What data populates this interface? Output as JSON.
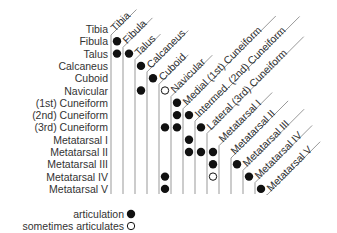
{
  "diagram": {
    "type": "articulation-matrix",
    "bones": [
      "Tibia",
      "Fibula",
      "Talus",
      "Calcaneus",
      "Cuboid",
      "Navicular",
      "(1st) Cuneiform",
      "(2nd) Cuneiform",
      "(3rd) Cuneiform",
      "Metatarsal I",
      "Metatarsal II",
      "Metatarsal III",
      "Metatarsal IV",
      "Metatarsal V"
    ],
    "column_labels": [
      "Tibia",
      "Fibula",
      "Talus",
      "Calcaneus",
      "Cuboid",
      "Navicular",
      "Medial (1st) Cuneiform",
      "Intermed. (2nd) Cuneiform",
      "Lateral (3rd) Cuneiform",
      "Metatarsal I",
      "Metatarsal II",
      "Metatarsal III",
      "Metatarsal IV",
      "Metatarsal V"
    ],
    "articulations": [
      {
        "row": "Fibula",
        "col": "Tibia",
        "type": "articulation"
      },
      {
        "row": "Talus",
        "col": "Tibia",
        "type": "articulation"
      },
      {
        "row": "Talus",
        "col": "Fibula",
        "type": "articulation"
      },
      {
        "row": "Calcaneus",
        "col": "Talus",
        "type": "articulation"
      },
      {
        "row": "Cuboid",
        "col": "Calcaneus",
        "type": "articulation"
      },
      {
        "row": "Navicular",
        "col": "Talus",
        "type": "articulation"
      },
      {
        "row": "Navicular",
        "col": "Cuboid",
        "type": "sometimes"
      },
      {
        "row": "(1st) Cuneiform",
        "col": "Navicular",
        "type": "articulation"
      },
      {
        "row": "(2nd) Cuneiform",
        "col": "Navicular",
        "type": "articulation"
      },
      {
        "row": "(2nd) Cuneiform",
        "col": "Medial (1st) Cuneiform",
        "type": "articulation"
      },
      {
        "row": "(3rd) Cuneiform",
        "col": "Cuboid",
        "type": "articulation"
      },
      {
        "row": "(3rd) Cuneiform",
        "col": "Navicular",
        "type": "articulation"
      },
      {
        "row": "(3rd) Cuneiform",
        "col": "Intermed. (2nd) Cuneiform",
        "type": "articulation"
      },
      {
        "row": "Metatarsal I",
        "col": "Medial (1st) Cuneiform",
        "type": "articulation"
      },
      {
        "row": "Metatarsal II",
        "col": "Medial (1st) Cuneiform",
        "type": "articulation"
      },
      {
        "row": "Metatarsal II",
        "col": "Intermed. (2nd) Cuneiform",
        "type": "articulation"
      },
      {
        "row": "Metatarsal II",
        "col": "Lateral (3rd) Cuneiform",
        "type": "articulation"
      },
      {
        "row": "Metatarsal III",
        "col": "Lateral (3rd) Cuneiform",
        "type": "articulation"
      },
      {
        "row": "Metatarsal III",
        "col": "Metatarsal II",
        "type": "articulation"
      },
      {
        "row": "Metatarsal IV",
        "col": "Cuboid",
        "type": "articulation"
      },
      {
        "row": "Metatarsal IV",
        "col": "Lateral (3rd) Cuneiform",
        "type": "sometimes"
      },
      {
        "row": "Metatarsal IV",
        "col": "Metatarsal III",
        "type": "articulation"
      },
      {
        "row": "Metatarsal V",
        "col": "Cuboid",
        "type": "articulation"
      },
      {
        "row": "Metatarsal V",
        "col": "Metatarsal IV",
        "type": "articulation"
      }
    ],
    "matrix": [
      [
        0,
        0,
        0,
        0,
        0,
        0,
        0,
        0,
        0,
        0,
        0,
        0,
        0,
        0
      ],
      [
        1,
        0,
        0,
        0,
        0,
        0,
        0,
        0,
        0,
        0,
        0,
        0,
        0,
        0
      ],
      [
        1,
        1,
        0,
        0,
        0,
        0,
        0,
        0,
        0,
        0,
        0,
        0,
        0,
        0
      ],
      [
        0,
        0,
        1,
        0,
        0,
        0,
        0,
        0,
        0,
        0,
        0,
        0,
        0,
        0
      ],
      [
        0,
        0,
        0,
        1,
        0,
        0,
        0,
        0,
        0,
        0,
        0,
        0,
        0,
        0
      ],
      [
        0,
        0,
        1,
        0,
        2,
        0,
        0,
        0,
        0,
        0,
        0,
        0,
        0,
        0
      ],
      [
        0,
        0,
        0,
        0,
        0,
        1,
        0,
        0,
        0,
        0,
        0,
        0,
        0,
        0
      ],
      [
        0,
        0,
        0,
        0,
        0,
        1,
        1,
        0,
        0,
        0,
        0,
        0,
        0,
        0
      ],
      [
        0,
        0,
        0,
        0,
        1,
        1,
        0,
        1,
        0,
        0,
        0,
        0,
        0,
        0
      ],
      [
        0,
        0,
        0,
        0,
        0,
        0,
        1,
        0,
        0,
        0,
        0,
        0,
        0,
        0
      ],
      [
        0,
        0,
        0,
        0,
        0,
        0,
        1,
        1,
        1,
        0,
        0,
        0,
        0,
        0
      ],
      [
        0,
        0,
        0,
        0,
        0,
        0,
        0,
        0,
        1,
        0,
        1,
        0,
        0,
        0
      ],
      [
        0,
        0,
        0,
        0,
        1,
        0,
        0,
        0,
        2,
        0,
        0,
        1,
        0,
        0
      ],
      [
        0,
        0,
        0,
        0,
        1,
        0,
        0,
        0,
        0,
        0,
        0,
        0,
        1,
        0
      ]
    ],
    "legend": {
      "articulation": "articulation",
      "sometimes": "sometimes articulates"
    },
    "colors": {
      "dot": "#111111",
      "grid_line": "#999999",
      "text": "#333333"
    }
  }
}
